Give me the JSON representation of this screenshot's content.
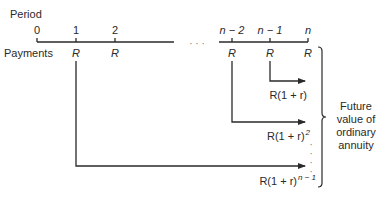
{
  "axis": {
    "period_label": "Period",
    "payments_label": "Payments",
    "ellipsis": "· · ·",
    "periods": [
      {
        "label": "0",
        "x": 37
      },
      {
        "label": "1",
        "x": 76
      },
      {
        "label": "2",
        "x": 115
      },
      {
        "label": "n − 2",
        "x": 232
      },
      {
        "label": "n − 1",
        "x": 270
      },
      {
        "label": "n",
        "x": 308
      }
    ],
    "payments": [
      {
        "label": "R",
        "x": 76
      },
      {
        "label": "R",
        "x": 115
      },
      {
        "label": "R",
        "x": 232
      },
      {
        "label": "R",
        "x": 270
      },
      {
        "label": "R",
        "x": 308
      }
    ]
  },
  "flows": [
    {
      "from": "n − 1",
      "base": "R(1 + r)",
      "exponent": ""
    },
    {
      "from": "n − 2",
      "base": "R(1 + r)",
      "exponent": "2"
    },
    {
      "from": "1",
      "base": "R(1 + r)",
      "exponent": "n − 1"
    }
  ],
  "vertical_ellipsis": "⋮",
  "brace_label": {
    "lines": [
      "Future",
      "value of",
      "ordinary",
      "annuity"
    ]
  }
}
